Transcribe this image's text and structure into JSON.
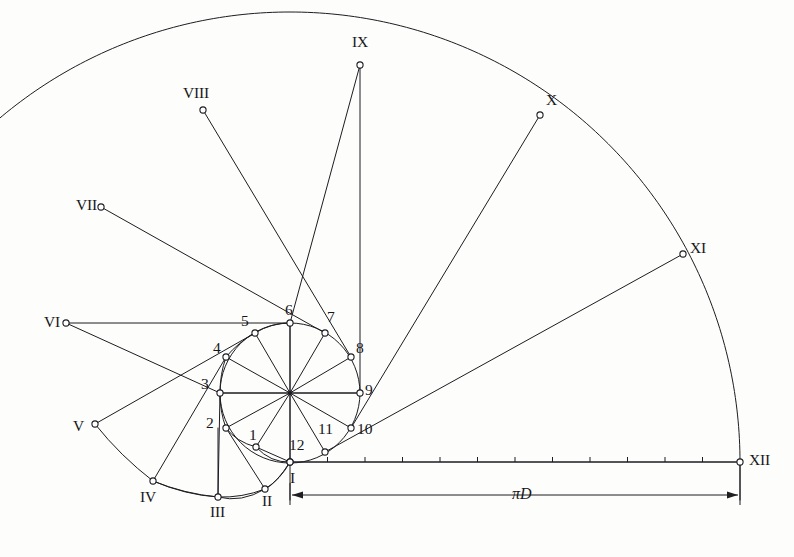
{
  "figure": {
    "background_color": "#fdfdfb",
    "ink_color": "#1d1d22",
    "node_fill": "#ffffff"
  },
  "geometry": {
    "circle_center": [
      290,
      393
    ],
    "circle_radius": 70,
    "baseline_y": 462,
    "baseline_start_x": 290,
    "baseline_end_x": 740,
    "divisions": 12,
    "big_arc_radius": 450,
    "big_arc_center": [
      290,
      462
    ]
  },
  "chart_data": {
    "type": "scatter",
    "xlabel": "",
    "ylabel": "",
    "inner_points": [
      {
        "label": "1",
        "x": 256,
        "y": 447
      },
      {
        "label": "2",
        "x": 226,
        "y": 428
      },
      {
        "label": "3",
        "x": 220,
        "y": 393
      },
      {
        "label": "4",
        "x": 226,
        "y": 357
      },
      {
        "label": "5",
        "x": 255,
        "y": 333
      },
      {
        "label": "6",
        "x": 290,
        "y": 323
      },
      {
        "label": "7",
        "x": 325,
        "y": 333
      },
      {
        "label": "8",
        "x": 351,
        "y": 357
      },
      {
        "label": "9",
        "x": 360,
        "y": 393
      },
      {
        "label": "10",
        "x": 351,
        "y": 428
      },
      {
        "label": "11",
        "x": 325,
        "y": 452
      },
      {
        "label": "12",
        "x": 290,
        "y": 462
      }
    ],
    "outer_points": [
      {
        "label": "I",
        "x": 290,
        "y": 462
      },
      {
        "label": "II",
        "x": 265,
        "y": 489
      },
      {
        "label": "III",
        "x": 218,
        "y": 497
      },
      {
        "label": "IV",
        "x": 153,
        "y": 481
      },
      {
        "label": "V",
        "x": 95,
        "y": 424
      },
      {
        "label": "VI",
        "x": 66,
        "y": 323
      },
      {
        "label": "VII",
        "x": 101,
        "y": 207
      },
      {
        "label": "VIII",
        "x": 203,
        "y": 110
      },
      {
        "label": "IX",
        "x": 360,
        "y": 65
      },
      {
        "label": "X",
        "x": 540,
        "y": 115
      },
      {
        "label": "XI",
        "x": 683,
        "y": 254
      },
      {
        "label": "XII",
        "x": 740,
        "y": 462
      }
    ],
    "inner_labels": [
      "1",
      "2",
      "3",
      "4",
      "5",
      "6",
      "7",
      "8",
      "9",
      "10",
      "11",
      "12"
    ],
    "outer_labels": [
      "I",
      "II",
      "III",
      "IV",
      "V",
      "VI",
      "VII",
      "VIII",
      "IX",
      "X",
      "XI",
      "XII"
    ],
    "annotations": [
      {
        "name": "dimension-label",
        "text_pi": "π",
        "text_d": "D",
        "x": 512,
        "y": 486
      }
    ],
    "dimension": {
      "label_pi": "π",
      "label_d": "D",
      "from": 290,
      "to": 740,
      "y": 495
    }
  },
  "labels": {
    "inner": [
      {
        "text": "1",
        "x": 249,
        "y": 427
      },
      {
        "text": "2",
        "x": 206,
        "y": 415
      },
      {
        "text": "3",
        "x": 201,
        "y": 376
      },
      {
        "text": "4",
        "x": 213,
        "y": 340
      },
      {
        "text": "5",
        "x": 241,
        "y": 313
      },
      {
        "text": "6",
        "x": 285,
        "y": 302
      },
      {
        "text": "7",
        "x": 327,
        "y": 309
      },
      {
        "text": "8",
        "x": 356,
        "y": 340
      },
      {
        "text": "9",
        "x": 365,
        "y": 382
      },
      {
        "text": "10",
        "x": 357,
        "y": 421
      },
      {
        "text": "11",
        "x": 318,
        "y": 421
      }
    ],
    "inner_twelve": {
      "text": "12",
      "x": 289,
      "y": 437
    },
    "outer": [
      {
        "text": "I",
        "x": 290,
        "y": 470
      },
      {
        "text": "II",
        "x": 262,
        "y": 493
      },
      {
        "text": "III",
        "x": 210,
        "y": 504
      },
      {
        "text": "IV",
        "x": 140,
        "y": 489
      },
      {
        "text": "V",
        "x": 73,
        "y": 418
      },
      {
        "text": "VI",
        "x": 44,
        "y": 314
      },
      {
        "text": "VII",
        "x": 76,
        "y": 197
      },
      {
        "text": "VIII",
        "x": 183,
        "y": 85
      },
      {
        "text": "IX",
        "x": 352,
        "y": 34
      },
      {
        "text": "X",
        "x": 546,
        "y": 92
      },
      {
        "text": "XI",
        "x": 690,
        "y": 240
      },
      {
        "text": "XII",
        "x": 749,
        "y": 452
      }
    ]
  }
}
